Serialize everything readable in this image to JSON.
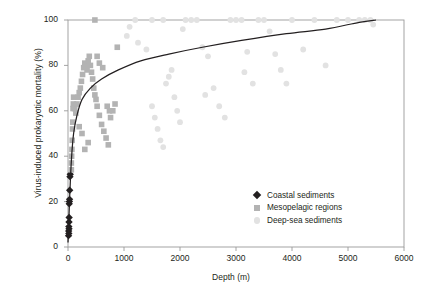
{
  "chart_data": {
    "type": "scatter",
    "title": "",
    "xlabel": "Depth (m)",
    "ylabel": "Virus-induced prokaryotic mortality (%)",
    "xlim": [
      0,
      6000
    ],
    "ylim": [
      0,
      100
    ],
    "xticks": [
      0,
      1000,
      2000,
      3000,
      4000,
      5000,
      6000
    ],
    "yticks": [
      0,
      20,
      40,
      60,
      80,
      100
    ],
    "grid": false,
    "legend_position": "bottom-right",
    "series": [
      {
        "name": "Coastal sediments",
        "marker": "diamond",
        "color": "#231f20",
        "points": [
          [
            10,
            5
          ],
          [
            12,
            7
          ],
          [
            15,
            9
          ],
          [
            18,
            11
          ],
          [
            20,
            13
          ],
          [
            22,
            19
          ],
          [
            25,
            20
          ],
          [
            28,
            21
          ],
          [
            30,
            25
          ],
          [
            35,
            31
          ],
          [
            40,
            32
          ],
          [
            15,
            6
          ],
          [
            18,
            8
          ]
        ]
      },
      {
        "name": "Mesopelagic regions",
        "marker": "square",
        "color": "#b3b3b3",
        "points": [
          [
            60,
            34
          ],
          [
            60,
            37
          ],
          [
            65,
            40
          ],
          [
            70,
            43
          ],
          [
            75,
            47
          ],
          [
            80,
            52
          ],
          [
            85,
            55
          ],
          [
            90,
            61
          ],
          [
            95,
            63
          ],
          [
            100,
            66
          ],
          [
            120,
            61
          ],
          [
            140,
            59
          ],
          [
            160,
            63
          ],
          [
            180,
            66
          ],
          [
            200,
            68
          ],
          [
            220,
            70
          ],
          [
            240,
            73
          ],
          [
            260,
            76
          ],
          [
            280,
            79
          ],
          [
            300,
            81
          ],
          [
            320,
            80
          ],
          [
            340,
            78
          ],
          [
            360,
            82
          ],
          [
            380,
            84
          ],
          [
            400,
            80
          ],
          [
            420,
            77
          ],
          [
            440,
            74
          ],
          [
            460,
            70
          ],
          [
            480,
            67
          ],
          [
            500,
            65
          ],
          [
            520,
            62
          ],
          [
            560,
            58
          ],
          [
            600,
            54
          ],
          [
            640,
            51
          ],
          [
            680,
            48
          ],
          [
            720,
            45
          ],
          [
            760,
            57
          ],
          [
            800,
            60
          ],
          [
            840,
            63
          ],
          [
            880,
            88
          ],
          [
            520,
            84
          ],
          [
            560,
            81
          ],
          [
            620,
            79
          ],
          [
            700,
            62
          ],
          [
            740,
            60
          ],
          [
            480,
            100
          ],
          [
            360,
            46
          ],
          [
            300,
            43
          ],
          [
            250,
            50
          ],
          [
            200,
            53
          ]
        ]
      },
      {
        "name": "Deep-sea sediments",
        "marker": "circle",
        "color": "#e2e2e2",
        "points": [
          [
            1050,
            93
          ],
          [
            1100,
            97
          ],
          [
            1200,
            100
          ],
          [
            1250,
            90
          ],
          [
            1400,
            87
          ],
          [
            1500,
            62
          ],
          [
            1550,
            57
          ],
          [
            1600,
            52
          ],
          [
            1650,
            47
          ],
          [
            1700,
            44
          ],
          [
            1750,
            72
          ],
          [
            1800,
            75
          ],
          [
            1850,
            78
          ],
          [
            1900,
            66
          ],
          [
            1950,
            60
          ],
          [
            2000,
            55
          ],
          [
            2100,
            100
          ],
          [
            2200,
            100
          ],
          [
            2300,
            100
          ],
          [
            2400,
            88
          ],
          [
            2500,
            84
          ],
          [
            2600,
            70
          ],
          [
            2700,
            62
          ],
          [
            2800,
            57
          ],
          [
            2900,
            100
          ],
          [
            3000,
            100
          ],
          [
            3100,
            100
          ],
          [
            3200,
            86
          ],
          [
            3300,
            72
          ],
          [
            3400,
            100
          ],
          [
            3500,
            100
          ],
          [
            3600,
            95
          ],
          [
            3700,
            85
          ],
          [
            3800,
            78
          ],
          [
            3900,
            72
          ],
          [
            4000,
            100
          ],
          [
            4200,
            87
          ],
          [
            4400,
            100
          ],
          [
            4600,
            80
          ],
          [
            4800,
            100
          ],
          [
            5000,
            100
          ],
          [
            5200,
            100
          ],
          [
            5300,
            100
          ],
          [
            5400,
            100
          ],
          [
            5450,
            98
          ],
          [
            1500,
            100
          ],
          [
            1700,
            100
          ],
          [
            2050,
            96
          ],
          [
            2450,
            67
          ],
          [
            3150,
            77
          ]
        ]
      }
    ],
    "fit_curve": {
      "description": "saturating logarithmic trend line",
      "color": "#231f20",
      "anchor_points": [
        [
          0,
          2
        ],
        [
          30,
          22
        ],
        [
          60,
          38
        ],
        [
          100,
          50
        ],
        [
          160,
          58
        ],
        [
          250,
          65
        ],
        [
          400,
          70
        ],
        [
          600,
          74
        ],
        [
          900,
          78
        ],
        [
          1300,
          82
        ],
        [
          1800,
          85
        ],
        [
          2400,
          88
        ],
        [
          3100,
          91
        ],
        [
          3900,
          94
        ],
        [
          4600,
          96
        ],
        [
          5200,
          99
        ],
        [
          5500,
          100
        ]
      ]
    }
  },
  "axes": {
    "y_tick_labels": [
      "0",
      "20",
      "40",
      "60",
      "80",
      "100"
    ],
    "x_tick_labels": [
      "0",
      "1000",
      "2000",
      "3000",
      "4000",
      "5000",
      "6000"
    ]
  },
  "legend": {
    "items": [
      {
        "label": "Coastal sediments",
        "marker": "diamond-marker"
      },
      {
        "label": "Mesopelagic regions",
        "marker": "square-marker"
      },
      {
        "label": "Deep-sea sediments",
        "marker": "circle-marker"
      }
    ]
  }
}
